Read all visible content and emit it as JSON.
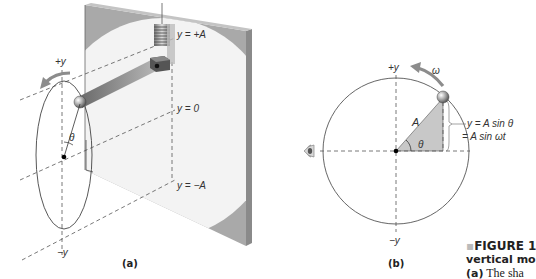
{
  "panel_a": {
    "label": "(a)",
    "plus_y": "+y",
    "minus_y": "−y",
    "theta": "θ",
    "level_top": "y = +A",
    "level_mid": "y = 0",
    "level_bottom": "y = −A"
  },
  "panel_b": {
    "label": "(b)",
    "plus_y": "+y",
    "minus_y": "−y",
    "omega": "ω",
    "radius_label": "A",
    "theta": "θ",
    "eq_line1": "y = A sin θ",
    "eq_line2": "= A sin ωt"
  },
  "caption": {
    "bullet": "▪",
    "title": "FIGURE 1",
    "line2": "vertical mo",
    "line3_prefix": "(a)",
    "line3_text": " The sha"
  },
  "colors": {
    "wall": "#a9a9a9",
    "wall_light": "#f2f2f2",
    "rod": "#7a7a7a",
    "arrow": "#8c8c8c",
    "wedge": "#c8c8c8",
    "line": "#555555"
  }
}
